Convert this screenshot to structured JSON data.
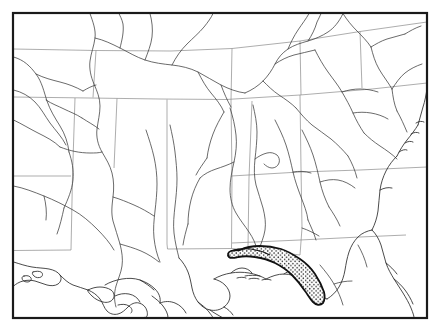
{
  "figure": {
    "name": "species-distribution-map",
    "title": "",
    "caption": "",
    "region": "Southeastern United States",
    "has_labels": false,
    "has_legend": false,
    "has_scale_bar": false,
    "has_north_arrow": false,
    "background_color": "#ffffff"
  },
  "frame": {
    "name": "map-border",
    "x": 13,
    "y": 13,
    "width": 414,
    "height": 305,
    "stroke_color": "#1a1a1a",
    "stroke_width": 2.2
  },
  "styles": {
    "coastline_color": "#2a2a2a",
    "coastline_width": 0.85,
    "river_color": "#3a3a3a",
    "river_width": 0.75,
    "state_boundary_color": "#8a8a8a",
    "state_boundary_width": 0.7,
    "range_outline_color": "#111111",
    "range_outline_width": 1.8,
    "range_fill_color": "#ffffff",
    "stipple_dot_color": "#2a2a2a",
    "stipple_dot_radius": 0.75
  },
  "range": {
    "name": "shaded-distribution-range",
    "description": "Stippled crescent along the Florida Panhandle Gulf coast",
    "fill_pattern": "stipple-dots",
    "extent": "Florida Panhandle coastal strip, Gulf of Mexico shoreline"
  },
  "features": {
    "state_boundaries_count": 14,
    "rivers_count": 46,
    "coastline_segments": 3
  }
}
